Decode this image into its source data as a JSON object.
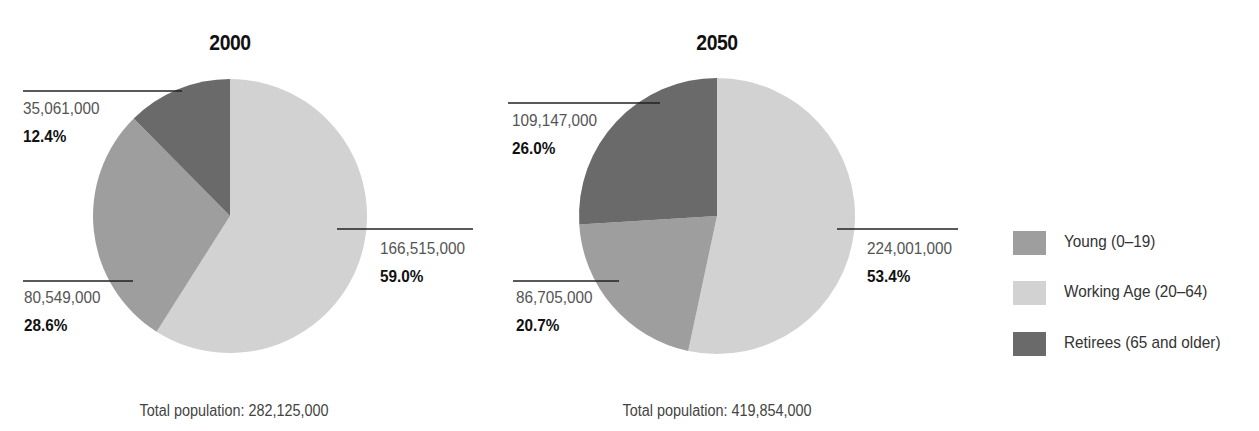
{
  "colors": {
    "young": "#9e9e9e",
    "working": "#d2d2d2",
    "retirees": "#6a6a6a",
    "leader": "#222222"
  },
  "legend": {
    "items": [
      {
        "key": "young",
        "label": "Young (0–19)"
      },
      {
        "key": "working",
        "label": "Working Age (20–64)"
      },
      {
        "key": "retirees",
        "label": "Retirees (65 and older)"
      }
    ]
  },
  "pies": [
    {
      "title": "2000",
      "total_label": "Total population: 282,125,000",
      "slices": {
        "working": {
          "value": "166,515,000",
          "pct": "59.0%"
        },
        "young": {
          "value": "80,549,000",
          "pct": "28.6%"
        },
        "retirees": {
          "value": "35,061,000",
          "pct": "12.4%"
        }
      }
    },
    {
      "title": "2050",
      "total_label": "Total population: 419,854,000",
      "slices": {
        "working": {
          "value": "224,001,000",
          "pct": "53.4%"
        },
        "young": {
          "value": "86,705,000",
          "pct": "20.7%"
        },
        "retirees": {
          "value": "109,147,000",
          "pct": "26.0%"
        }
      }
    }
  ],
  "chart_data": [
    {
      "type": "pie",
      "title": "2000",
      "categories": [
        "Working Age (20–64)",
        "Young (0–19)",
        "Retirees (65 and older)"
      ],
      "values": [
        166515000,
        80549000,
        35061000
      ],
      "percentages": [
        59.0,
        28.6,
        12.4
      ],
      "total": 282125000,
      "annotation": "Total population: 282,125,000",
      "legend_position": "right"
    },
    {
      "type": "pie",
      "title": "2050",
      "categories": [
        "Working Age (20–64)",
        "Young (0–19)",
        "Retirees (65 and older)"
      ],
      "values": [
        224001000,
        86705000,
        109147000
      ],
      "percentages": [
        53.4,
        20.7,
        26.0
      ],
      "total": 419854000,
      "annotation": "Total population: 419,854,000",
      "legend_position": "right"
    }
  ]
}
